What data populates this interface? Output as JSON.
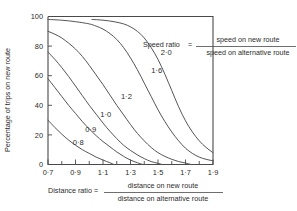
{
  "chart_data": {
    "type": "line",
    "title": "",
    "xlabel": "Distance ratio",
    "ylabel": "Percentage of trips on new route",
    "xlim": [
      0.7,
      1.9
    ],
    "ylim": [
      0,
      100
    ],
    "grid": false,
    "legend_position": "inline-curve-labels",
    "x_ticks": [
      "0·7",
      "0·9",
      "1·1",
      "1·3",
      "1·5",
      "1·7",
      "1·9"
    ],
    "x_tick_values": [
      0.7,
      0.9,
      1.1,
      1.3,
      1.5,
      1.7,
      1.9
    ],
    "x_minor_step": 0.1,
    "y_ticks": [
      "0",
      "20",
      "40",
      "60",
      "80",
      "100"
    ],
    "y_tick_values": [
      0,
      20,
      40,
      60,
      80,
      100
    ],
    "series_label_name": "Speed ratio",
    "series": [
      {
        "name": "0·8",
        "label": "0·8",
        "label_x": 0.92,
        "label_y": 13,
        "points": [
          [
            0.7,
            30
          ],
          [
            0.75,
            25
          ],
          [
            0.8,
            20.5
          ],
          [
            0.85,
            16.5
          ],
          [
            0.9,
            13
          ],
          [
            0.95,
            10
          ],
          [
            1.0,
            7.5
          ],
          [
            1.05,
            5
          ],
          [
            1.1,
            3
          ],
          [
            1.15,
            1.2
          ],
          [
            1.18,
            0
          ]
        ]
      },
      {
        "name": "0·9",
        "label": "0·9",
        "label_x": 1.01,
        "label_y": 22,
        "points": [
          [
            0.7,
            58
          ],
          [
            0.75,
            52
          ],
          [
            0.8,
            46
          ],
          [
            0.85,
            40
          ],
          [
            0.9,
            34.5
          ],
          [
            0.95,
            29
          ],
          [
            1.0,
            24
          ],
          [
            1.05,
            19.5
          ],
          [
            1.1,
            15.5
          ],
          [
            1.15,
            12
          ],
          [
            1.2,
            8.5
          ],
          [
            1.25,
            5.5
          ],
          [
            1.3,
            3
          ],
          [
            1.35,
            1.2
          ],
          [
            1.39,
            0
          ]
        ]
      },
      {
        "name": "1·0",
        "label": "1·0",
        "label_x": 1.12,
        "label_y": 32,
        "points": [
          [
            0.7,
            76
          ],
          [
            0.75,
            71
          ],
          [
            0.8,
            65.5
          ],
          [
            0.85,
            59.5
          ],
          [
            0.9,
            53
          ],
          [
            0.95,
            46.5
          ],
          [
            1.0,
            40
          ],
          [
            1.05,
            34
          ],
          [
            1.1,
            28
          ],
          [
            1.15,
            22.5
          ],
          [
            1.2,
            17.5
          ],
          [
            1.25,
            13
          ],
          [
            1.3,
            9.5
          ],
          [
            1.35,
            6.5
          ],
          [
            1.4,
            4
          ],
          [
            1.45,
            2
          ],
          [
            1.5,
            0.8
          ],
          [
            1.53,
            0
          ]
        ]
      },
      {
        "name": "1·2",
        "label": "1·2",
        "label_x": 1.27,
        "label_y": 44,
        "points": [
          [
            0.7,
            90
          ],
          [
            0.75,
            88
          ],
          [
            0.8,
            85.5
          ],
          [
            0.85,
            82
          ],
          [
            0.9,
            78
          ],
          [
            0.95,
            73
          ],
          [
            1.0,
            67
          ],
          [
            1.05,
            60.5
          ],
          [
            1.1,
            54
          ],
          [
            1.15,
            47
          ],
          [
            1.2,
            40
          ],
          [
            1.25,
            33.5
          ],
          [
            1.3,
            27
          ],
          [
            1.35,
            21
          ],
          [
            1.4,
            16
          ],
          [
            1.45,
            11.5
          ],
          [
            1.5,
            8
          ],
          [
            1.55,
            5.5
          ],
          [
            1.6,
            3.5
          ],
          [
            1.65,
            2
          ],
          [
            1.7,
            1
          ],
          [
            1.74,
            0
          ]
        ]
      },
      {
        "name": "1·6",
        "label": "1·6",
        "label_x": 1.49,
        "label_y": 62,
        "points": [
          [
            0.7,
            98
          ],
          [
            0.8,
            97.5
          ],
          [
            0.9,
            96.5
          ],
          [
            1.0,
            95
          ],
          [
            1.05,
            93.5
          ],
          [
            1.1,
            91.5
          ],
          [
            1.15,
            88.5
          ],
          [
            1.2,
            84.5
          ],
          [
            1.25,
            79
          ],
          [
            1.3,
            72
          ],
          [
            1.35,
            64
          ],
          [
            1.4,
            55
          ],
          [
            1.45,
            46
          ],
          [
            1.5,
            37
          ],
          [
            1.55,
            29
          ],
          [
            1.6,
            22
          ],
          [
            1.65,
            16
          ],
          [
            1.7,
            11
          ],
          [
            1.75,
            7.5
          ],
          [
            1.8,
            5
          ],
          [
            1.85,
            3.5
          ],
          [
            1.9,
            2.5
          ]
        ]
      },
      {
        "name": "2·0",
        "label": "2·0",
        "label_x": 1.56,
        "label_y": 74,
        "points": [
          [
            1.02,
            98
          ],
          [
            1.1,
            97.5
          ],
          [
            1.18,
            96.5
          ],
          [
            1.25,
            95
          ],
          [
            1.3,
            93
          ],
          [
            1.35,
            90
          ],
          [
            1.4,
            85.5
          ],
          [
            1.45,
            79
          ],
          [
            1.5,
            71
          ],
          [
            1.55,
            61
          ],
          [
            1.6,
            50
          ],
          [
            1.65,
            39
          ],
          [
            1.7,
            29.5
          ],
          [
            1.75,
            22
          ],
          [
            1.8,
            16
          ],
          [
            1.85,
            11.5
          ],
          [
            1.9,
            8
          ]
        ]
      }
    ],
    "annotations": {
      "speed_ratio": {
        "label": "Speed ratio",
        "equals": "=",
        "numerator": "speed on new route",
        "denominator": "speed on alternative route"
      },
      "distance_ratio": {
        "label": "Distance ratio",
        "equals": "=",
        "numerator": "distance on new route",
        "denominator": "distance on alternative route"
      }
    }
  },
  "colors": {
    "curve": "#555555",
    "axis": "#4a4a4a",
    "text": "#2b2b2b",
    "background": "#ffffff"
  }
}
